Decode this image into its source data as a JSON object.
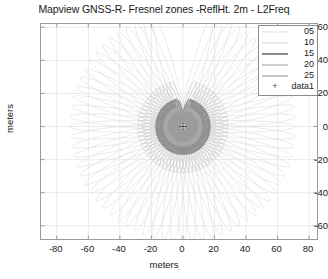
{
  "chart_data": {
    "type": "scatter",
    "title": "Mapview GNSS-R- Fresnel zones -ReflHt. 2m - L2Freq",
    "xlabel": "meters",
    "ylabel": "meters",
    "xlim": [
      -90,
      85
    ],
    "ylim": [
      -68,
      62
    ],
    "xticks": [
      -80,
      -60,
      -40,
      -20,
      0,
      20,
      40,
      60,
      80
    ],
    "yticks": [
      60,
      40,
      20,
      0,
      -20,
      -40,
      -60
    ],
    "xtick_labels": [
      "-80",
      "-60",
      "-40",
      "-20",
      "0",
      "20",
      "40",
      "60",
      "80"
    ],
    "ytick_labels": [
      "60",
      "40",
      "20",
      "0",
      "-20",
      "-40",
      "-60"
    ],
    "grid": true,
    "legend_position": "top-right",
    "series": [
      {
        "name": "05",
        "elevation_deg": 5,
        "color": "#e2e2e2",
        "linewidth": 0.7,
        "type": "fresnel-ellipse-set"
      },
      {
        "name": "10",
        "elevation_deg": 10,
        "color": "#d0d0d0",
        "linewidth": 0.8,
        "type": "fresnel-ellipse-set"
      },
      {
        "name": "15",
        "elevation_deg": 15,
        "color": "#8f8f8f",
        "linewidth": 1.4,
        "type": "fresnel-ellipse-set"
      },
      {
        "name": "20",
        "elevation_deg": 20,
        "color": "#a8a8a8",
        "linewidth": 1.4,
        "type": "fresnel-ellipse-set"
      },
      {
        "name": "25",
        "elevation_deg": 25,
        "color": "#9c9c9c",
        "linewidth": 1.4,
        "type": "fresnel-ellipse-set"
      },
      {
        "name": "data1",
        "marker": "+",
        "color": "#4a4a4a",
        "type": "marker",
        "points": [
          [
            0,
            0
          ]
        ]
      }
    ],
    "annotations": {
      "station_marker": "+ at origin (0,0)",
      "pattern": "radial fan of Fresnel zone ellipses emanating from receiver at origin, gap wedge toward north"
    }
  },
  "legend": {
    "items": [
      {
        "label": "05",
        "kind": "line",
        "color": "#e2e2e2",
        "width": 0.7
      },
      {
        "label": "10",
        "kind": "line",
        "color": "#d4d4d4",
        "width": 0.9
      },
      {
        "label": "15",
        "kind": "line",
        "color": "#8a8a8a",
        "width": 2.0
      },
      {
        "label": "20",
        "kind": "line",
        "color": "#9e9e9e",
        "width": 1.8
      },
      {
        "label": "25",
        "kind": "line",
        "color": "#949494",
        "width": 1.6
      },
      {
        "label": "data1",
        "kind": "marker",
        "marker": "+",
        "color": "#4a4a4a"
      }
    ]
  },
  "colors": {
    "axis": "#9a9a9a",
    "grid": "#ebebeb",
    "text": "#1a1a1a",
    "background": "#ffffff"
  }
}
